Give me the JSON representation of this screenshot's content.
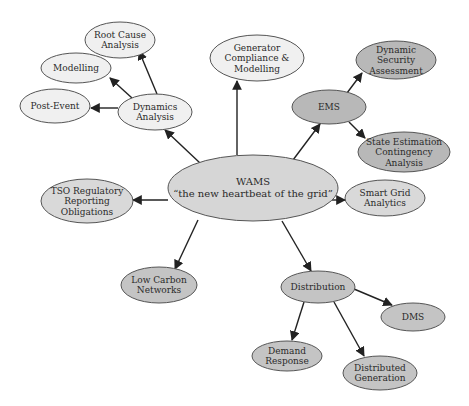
{
  "diagram": {
    "type": "mind-map",
    "colors": {
      "light_fill": "#f0f0f0",
      "medium_fill": "#d9d9d9",
      "dark_fill": "#b8b8b8",
      "stroke": "#555555",
      "edge": "#222222"
    },
    "nodes": [
      {
        "id": "wams",
        "lines": [
          "WAMS",
          "“the new heartbeat of the grid”"
        ],
        "cx": 253,
        "cy": 188,
        "rx": 85,
        "ry": 33,
        "fill": "#d6d6d6"
      },
      {
        "id": "dynamics",
        "lines": [
          "Dynamics",
          "Analysis"
        ],
        "cx": 155,
        "cy": 112,
        "rx": 37,
        "ry": 18,
        "fill": "#f0f0f0"
      },
      {
        "id": "root-cause",
        "lines": [
          "Root Cause",
          "Analysis"
        ],
        "cx": 120,
        "cy": 40,
        "rx": 35,
        "ry": 18,
        "fill": "#f0f0f0"
      },
      {
        "id": "modelling",
        "lines": [
          "Modelling"
        ],
        "cx": 76,
        "cy": 68,
        "rx": 35,
        "ry": 15,
        "fill": "#f0f0f0"
      },
      {
        "id": "post-event",
        "lines": [
          "Post-Event"
        ],
        "cx": 55,
        "cy": 106,
        "rx": 35,
        "ry": 17,
        "fill": "#f0f0f0"
      },
      {
        "id": "generator",
        "lines": [
          "Generator",
          "Compliance &",
          "Modelling"
        ],
        "cx": 257,
        "cy": 58,
        "rx": 47,
        "ry": 23,
        "fill": "#f0f0f0"
      },
      {
        "id": "ems",
        "lines": [
          "EMS"
        ],
        "cx": 329,
        "cy": 107,
        "rx": 37,
        "ry": 17,
        "fill": "#b8b8b8"
      },
      {
        "id": "dsa",
        "lines": [
          "Dynamic",
          "Security",
          "Assessment"
        ],
        "cx": 396,
        "cy": 60,
        "rx": 40,
        "ry": 19,
        "fill": "#b8b8b8"
      },
      {
        "id": "state-est",
        "lines": [
          "State Estimation",
          "Contingency",
          "Analysis"
        ],
        "cx": 404,
        "cy": 152,
        "rx": 46,
        "ry": 20,
        "fill": "#b8b8b8"
      },
      {
        "id": "tso",
        "lines": [
          "TSO Regulatory",
          "Reporting",
          "Obligations"
        ],
        "cx": 87,
        "cy": 201,
        "rx": 46,
        "ry": 22,
        "fill": "#d9d9d9"
      },
      {
        "id": "smart-grid",
        "lines": [
          "Smart Grid",
          "Analytics"
        ],
        "cx": 385,
        "cy": 198,
        "rx": 40,
        "ry": 18,
        "fill": "#d9d9d9"
      },
      {
        "id": "low-carbon",
        "lines": [
          "Low Carbon",
          "Networks"
        ],
        "cx": 159,
        "cy": 285,
        "rx": 38,
        "ry": 18,
        "fill": "#c4c4c4"
      },
      {
        "id": "distribution",
        "lines": [
          "Distribution"
        ],
        "cx": 318,
        "cy": 287,
        "rx": 37,
        "ry": 16,
        "fill": "#c4c4c4"
      },
      {
        "id": "dms",
        "lines": [
          "DMS"
        ],
        "cx": 413,
        "cy": 317,
        "rx": 32,
        "ry": 14,
        "fill": "#c4c4c4"
      },
      {
        "id": "demand-response",
        "lines": [
          "Demand",
          "Response"
        ],
        "cx": 287,
        "cy": 356,
        "rx": 35,
        "ry": 15,
        "fill": "#c4c4c4"
      },
      {
        "id": "dist-gen",
        "lines": [
          "Distributed",
          "Generation"
        ],
        "cx": 380,
        "cy": 373,
        "rx": 37,
        "ry": 17,
        "fill": "#c4c4c4"
      }
    ],
    "edges": [
      {
        "from": "wams",
        "to": "dynamics",
        "x1": 200,
        "y1": 163,
        "x2": 165,
        "y2": 130
      },
      {
        "from": "wams",
        "to": "generator",
        "x1": 237,
        "y1": 155,
        "x2": 237,
        "y2": 81
      },
      {
        "from": "wams",
        "to": "ems",
        "x1": 287,
        "y1": 168,
        "x2": 320,
        "y2": 124
      },
      {
        "from": "wams",
        "to": "tso",
        "x1": 168,
        "y1": 200,
        "x2": 133,
        "y2": 200
      },
      {
        "from": "wams",
        "to": "smart-grid",
        "x1": 314,
        "y1": 200,
        "x2": 345,
        "y2": 200
      },
      {
        "from": "wams",
        "to": "low-carbon",
        "x1": 198,
        "y1": 220,
        "x2": 175,
        "y2": 269
      },
      {
        "from": "wams",
        "to": "distribution",
        "x1": 282,
        "y1": 221,
        "x2": 311,
        "y2": 271
      },
      {
        "from": "dynamics",
        "to": "root-cause",
        "x1": 157,
        "y1": 94,
        "x2": 139,
        "y2": 51
      },
      {
        "from": "dynamics",
        "to": "modelling",
        "x1": 132,
        "y1": 98,
        "x2": 110,
        "y2": 78
      },
      {
        "from": "dynamics",
        "to": "post-event",
        "x1": 118,
        "y1": 108,
        "x2": 91,
        "y2": 108
      },
      {
        "from": "ems",
        "to": "dsa",
        "x1": 347,
        "y1": 93,
        "x2": 362,
        "y2": 73
      },
      {
        "from": "ems",
        "to": "state-est",
        "x1": 349,
        "y1": 122,
        "x2": 365,
        "y2": 138
      },
      {
        "from": "distribution",
        "to": "dms",
        "x1": 354,
        "y1": 289,
        "x2": 392,
        "y2": 305
      },
      {
        "from": "distribution",
        "to": "demand-response",
        "x1": 304,
        "y1": 302,
        "x2": 292,
        "y2": 340
      },
      {
        "from": "distribution",
        "to": "dist-gen",
        "x1": 334,
        "y1": 302,
        "x2": 364,
        "y2": 356
      }
    ]
  }
}
